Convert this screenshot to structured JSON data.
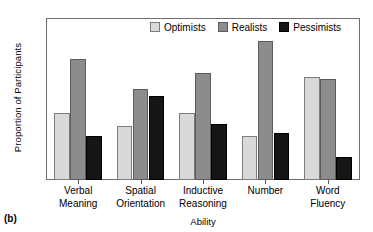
{
  "panel": {
    "label": "(b)"
  },
  "legend": {
    "position": "top-right-inside",
    "items": [
      {
        "label": "Optimists",
        "key": "optimists",
        "color": "#d9d9d9",
        "swatch_name": "legend-swatch-optimists"
      },
      {
        "label": "Realists",
        "key": "realists",
        "color": "#8c8c8c",
        "swatch_name": "legend-swatch-realists"
      },
      {
        "label": "Pessimists",
        "key": "pessimists",
        "color": "#151515",
        "swatch_name": "legend-swatch-pessimists"
      }
    ]
  },
  "axes": {
    "y_title": "Proportion of Participants",
    "x_title": "Ability",
    "y_ticks": [
      "0",
      "10",
      "20",
      "30",
      "40",
      "50",
      "60",
      "70"
    ],
    "x_tick_labels": [
      [
        "Verbal",
        "Meaning"
      ],
      [
        "Spatial",
        "Orientation"
      ],
      [
        "Inductive",
        "Reasoning"
      ],
      [
        "Number"
      ],
      [
        "Word",
        "Fluency"
      ]
    ]
  },
  "chart_data": {
    "type": "bar",
    "title": "",
    "xlabel": "Ability",
    "ylabel": "Proportion of Participants",
    "ylim": [
      0,
      70
    ],
    "ytick_step": 10,
    "grid": false,
    "legend_position": "upper right (inside plot)",
    "categories": [
      "Verbal Meaning",
      "Spatial Orientation",
      "Inductive Reasoning",
      "Number",
      "Word Fluency"
    ],
    "series": [
      {
        "name": "Optimists",
        "color": "#d9d9d9",
        "values": [
          29,
          23.5,
          29,
          19,
          45
        ]
      },
      {
        "name": "Realists",
        "color": "#8c8c8c",
        "values": [
          52.5,
          39.5,
          46.5,
          60.5,
          44
        ]
      },
      {
        "name": "Pessimists",
        "color": "#151515",
        "values": [
          19,
          36.5,
          24.5,
          20.5,
          10
        ]
      }
    ],
    "annotations": [
      "(b)"
    ]
  }
}
